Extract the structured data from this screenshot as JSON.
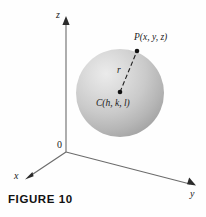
{
  "figure": {
    "caption": "FIGURE 10",
    "background_color": "#fefefe",
    "ink_color": "#1a1a1a"
  },
  "axes": {
    "z_label": "z",
    "y_label": "y",
    "x_label": "x",
    "origin_label": "0",
    "axis_color": "#6b6b6b"
  },
  "sphere": {
    "center_label": "C(h, k, l)",
    "point_label": "P(x, y, z)",
    "radius_label": "r",
    "fill_light": "#e3e3e3",
    "fill_mid": "#c9c9c9",
    "fill_dark": "#a8a8a8",
    "center_x": 120,
    "center_y": 93,
    "radius_px": 44,
    "point_x": 137,
    "point_y": 51
  },
  "icons": {
    "z_arrow": "arrow-up-icon",
    "y_arrow": "arrow-right-icon",
    "x_arrow": "arrow-left-icon",
    "center_dot": "point-marker-icon",
    "surface_dot": "point-marker-icon",
    "radius_line": "dashed-segment-icon"
  }
}
